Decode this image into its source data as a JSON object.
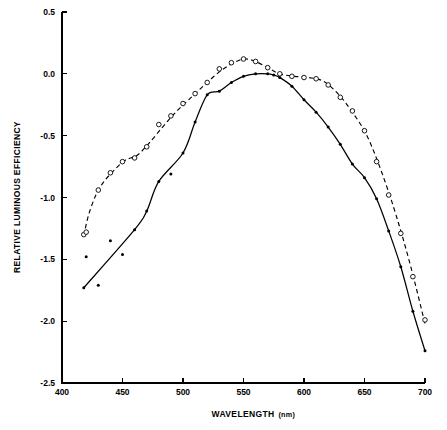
{
  "chart_data": {
    "type": "line",
    "title": "",
    "xlabel": "WAVELENGTH",
    "xlabel_unit": "(nm)",
    "ylabel": "RELATIVE LUMINOUS EFFICIENCY",
    "xlim": [
      400,
      700
    ],
    "ylim": [
      -2.5,
      0.5
    ],
    "xticks": [
      400,
      450,
      500,
      550,
      600,
      650,
      700
    ],
    "xticklabels": [
      "400",
      "450",
      "500",
      "550",
      "600",
      "650",
      "700"
    ],
    "yticks": [
      0.5,
      0.0,
      -0.5,
      -1.0,
      -1.5,
      -2.0,
      -2.5
    ],
    "yticklabels": [
      "0.5",
      "0.0",
      "-0.5",
      "-1.0",
      "-1.5",
      "-2.0",
      "-2.5"
    ],
    "grid": false,
    "legend": "none",
    "background": "#ffffff",
    "foreground": "#000000",
    "series": [
      {
        "name": "scotopic-open-circles",
        "marker": "open-circle",
        "linestyle": "dashed",
        "x": [
          418,
          420,
          430,
          440,
          450,
          460,
          470,
          480,
          490,
          500,
          510,
          520,
          530,
          540,
          550,
          560,
          570,
          580,
          590,
          600,
          610,
          620,
          630,
          640,
          650,
          660,
          670,
          680,
          690,
          700
        ],
        "y": [
          -1.3,
          -1.28,
          -0.94,
          -0.8,
          -0.71,
          -0.68,
          -0.59,
          -0.41,
          -0.34,
          -0.24,
          -0.16,
          -0.07,
          0.04,
          0.09,
          0.12,
          0.1,
          0.05,
          0.0,
          -0.02,
          -0.03,
          -0.04,
          -0.09,
          -0.19,
          -0.3,
          -0.46,
          -0.71,
          -0.98,
          -1.29,
          -1.64,
          -1.99
        ],
        "curve_x": [
          418,
          422,
          428,
          434,
          442,
          452,
          462,
          472,
          484,
          496,
          508,
          520,
          532,
          544,
          552,
          560,
          570,
          580,
          592,
          604,
          616,
          628,
          640,
          652,
          664,
          676,
          688,
          700
        ],
        "curve_y": [
          -1.31,
          -1.14,
          -0.98,
          -0.88,
          -0.79,
          -0.7,
          -0.66,
          -0.56,
          -0.42,
          -0.29,
          -0.18,
          -0.07,
          0.03,
          0.1,
          0.12,
          0.1,
          0.05,
          0.0,
          -0.02,
          -0.03,
          -0.06,
          -0.16,
          -0.31,
          -0.5,
          -0.79,
          -1.14,
          -1.55,
          -2.02
        ]
      },
      {
        "name": "photopic-filled-dots",
        "marker": "filled-dot",
        "linestyle": "solid",
        "x": [
          418,
          420,
          430,
          440,
          450,
          460,
          470,
          480,
          490,
          500,
          510,
          520,
          530,
          540,
          550,
          560,
          570,
          575,
          580,
          590,
          600,
          610,
          620,
          630,
          640,
          650,
          660,
          670,
          680,
          690,
          700
        ],
        "y": [
          -1.73,
          -1.48,
          -1.71,
          -1.35,
          -1.46,
          -1.26,
          -1.11,
          -0.87,
          -0.81,
          -0.64,
          -0.39,
          -0.17,
          -0.14,
          -0.07,
          -0.02,
          0.0,
          0.0,
          -0.01,
          -0.03,
          -0.1,
          -0.21,
          -0.31,
          -0.43,
          -0.57,
          -0.73,
          -0.84,
          -1.01,
          -1.27,
          -1.56,
          -1.92,
          -2.24
        ]
      }
    ],
    "scatter_outliers": {
      "name": "photopic-scatter",
      "x": [
        420,
        430,
        440,
        450,
        490,
        520
      ],
      "y": [
        -1.48,
        -1.71,
        -1.35,
        -1.46,
        -0.81,
        -0.17
      ]
    }
  },
  "axes": {
    "tick_count_x": 7,
    "tick_count_y": 7
  }
}
